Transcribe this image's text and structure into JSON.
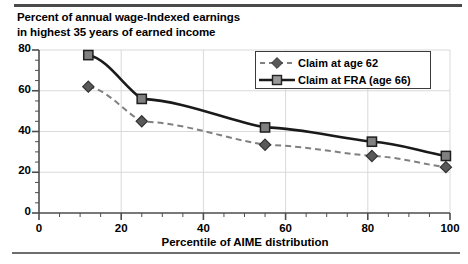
{
  "chart_data": {
    "type": "line",
    "title": "Percent of annual wage-Indexed earnings in highest 35 years of earned income",
    "title_lines": [
      "Percent of annual wage-Indexed earnings",
      "in highest 35 years of earned income"
    ],
    "xlabel": "Percentile of AIME distribution",
    "ylabel": "",
    "xlim": [
      0,
      100
    ],
    "ylim": [
      0,
      80
    ],
    "xticks": [
      0,
      20,
      40,
      60,
      80,
      100
    ],
    "yticks": [
      0,
      20,
      40,
      60,
      80
    ],
    "x_minor_tick_step": 5,
    "y_minor_tick_step": 5,
    "grid": true,
    "legend_position": "top-right",
    "series": [
      {
        "name": "Claim at age 62",
        "marker": "diamond",
        "line_style": "dashed",
        "color": "#808080",
        "marker_color": "#595959",
        "x": [
          12,
          25,
          55,
          81,
          99
        ],
        "values": [
          62,
          45,
          33.5,
          28,
          22.5
        ]
      },
      {
        "name": "Claim at FRA (age 66)",
        "marker": "square",
        "line_style": "solid",
        "color": "#1a1a1a",
        "marker_color": "#808080",
        "x": [
          12,
          25,
          55,
          81,
          99
        ],
        "values": [
          77.5,
          56,
          42,
          35,
          28
        ]
      }
    ],
    "colors": {
      "axis": "#4d4d4d",
      "grid": "#d9d9d9",
      "frame_rule": "#4a4a4a",
      "background": "#ffffff"
    }
  },
  "legend": {
    "items": [
      {
        "label": "Claim at age 62"
      },
      {
        "label": "Claim at FRA (age 66)"
      }
    ]
  },
  "axis": {
    "y_labels": [
      "80",
      "60",
      "40",
      "20",
      "0"
    ],
    "x_labels": [
      "0",
      "20",
      "40",
      "60",
      "80",
      "100"
    ],
    "x_title": "Percentile of AIME distribution"
  }
}
